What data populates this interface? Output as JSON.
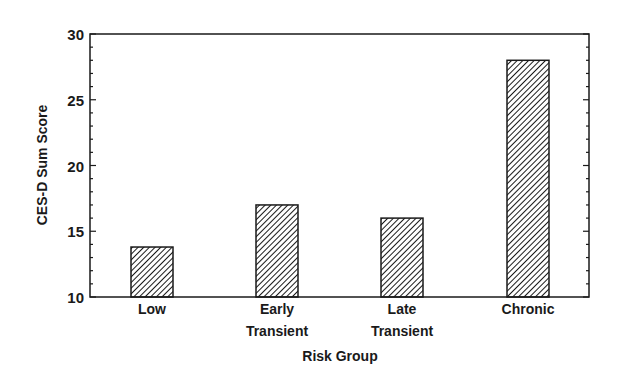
{
  "chart_data": {
    "type": "bar",
    "title": "",
    "xlabel": "Risk Group",
    "ylabel": "CES-D Sum Score",
    "categories": [
      "Low",
      "Early Transient",
      "Late Transient",
      "Chronic"
    ],
    "category_lines": [
      [
        "Low"
      ],
      [
        "Early",
        "Transient"
      ],
      [
        "Late",
        "Transient"
      ],
      [
        "Chronic"
      ]
    ],
    "values": [
      13.8,
      17.0,
      16.0,
      28.0
    ],
    "ylim": [
      10,
      30
    ],
    "yticks": [
      10,
      15,
      20,
      25,
      30
    ],
    "minor_tick_step": 1,
    "grid": false,
    "legend": null,
    "bar_fill": "diagonal-hatch",
    "colors": {
      "ink": "#1a1a1a",
      "background": "#ffffff"
    }
  }
}
